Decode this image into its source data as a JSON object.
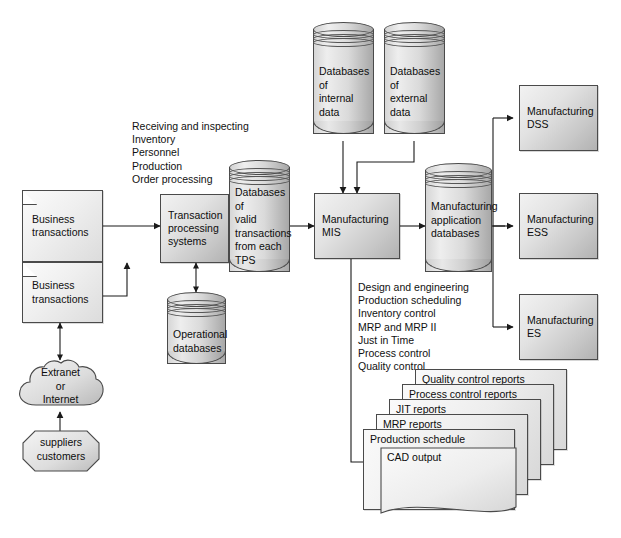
{
  "diagram": {
    "title": "Manufacturing MIS",
    "colors": {
      "stroke": "#4a4a4a",
      "arrow": "#1a1a1a",
      "fill_light": "#f2f2f2",
      "fill_dark": "#b2b2b2",
      "background": "#ffffff"
    }
  },
  "inputs": {
    "business_transactions_1": "Business\ntransactions",
    "business_transactions_2": "Business\ntransactions",
    "extranet": "Extranet\nor\nInternet",
    "suppliers": "suppliers\ncustomers"
  },
  "tps": {
    "label": "Transaction\nprocessing\nsystems",
    "functions": "Receiving and inspecting\nInventory\nPersonnel\nProduction\nOrder processing",
    "operational_db": "Operational\ndatabases",
    "valid_tx_db": "Databases\nof\nvalid\ntransactions\nfrom each\nTPS"
  },
  "sources": {
    "internal_db": "Databases\nof\ninternal\ndata",
    "external_db": "Databases\nof\nexternal\ndata"
  },
  "core": {
    "mis": "Manufacturing\nMIS",
    "app_db": "Manufacturing\napplication\ndatabases",
    "subsystems": "Design and engineering\nProduction scheduling\nInventory control\nMRP and MRP II\nJust in Time\nProcess control\nQuality control"
  },
  "outputs": {
    "dss": "Manufacturing\nDSS",
    "ess": "Manufacturing\nESS",
    "es": "Manufacturing\nES"
  },
  "reports": [
    {
      "label": "Quality control reports"
    },
    {
      "label": "Process control reports"
    },
    {
      "label": "JIT reports"
    },
    {
      "label": "MRP reports"
    },
    {
      "label": "Production schedule"
    },
    {
      "label": "CAD output"
    }
  ]
}
